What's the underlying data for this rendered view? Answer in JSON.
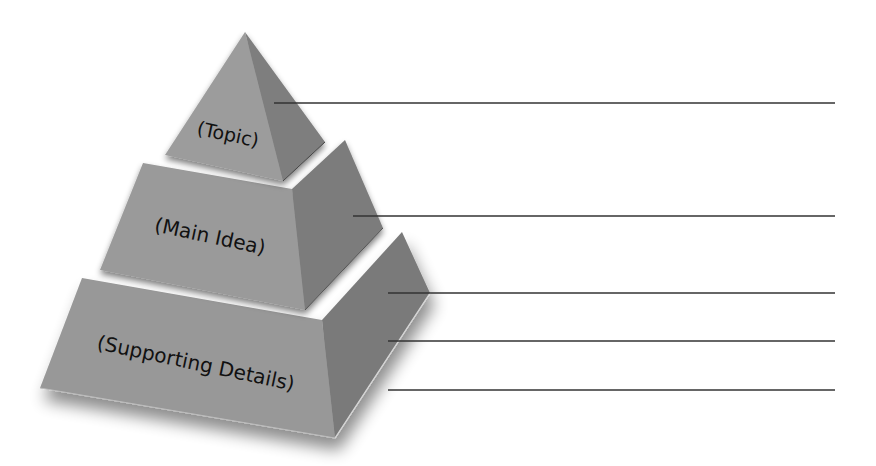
{
  "diagram": {
    "type": "pyramid",
    "tiers": [
      {
        "id": "topic",
        "label": "(Topic)",
        "front_color": "#9c9c9c",
        "side_color": "#7e7e7e",
        "font_size": 19,
        "text_x": 228,
        "text_y": 141
      },
      {
        "id": "main-idea",
        "label": "(Main Idea)",
        "front_color": "#9a9a9a",
        "side_color": "#7c7c7c",
        "font_size": 20,
        "text_x": 210,
        "text_y": 243
      },
      {
        "id": "supporting-details",
        "label": "(Supporting Details)",
        "front_color": "#989898",
        "side_color": "#7a7a7a",
        "font_size": 20,
        "text_x": 196,
        "text_y": 370
      }
    ],
    "answer_lines": [
      {
        "x1": 274,
        "y1": 103,
        "x2": 835,
        "y2": 103
      },
      {
        "x1": 353,
        "y1": 216,
        "x2": 835,
        "y2": 216
      },
      {
        "x1": 388,
        "y1": 293,
        "x2": 835,
        "y2": 293
      },
      {
        "x1": 388,
        "y1": 341,
        "x2": 835,
        "y2": 341
      },
      {
        "x1": 388,
        "y1": 390,
        "x2": 835,
        "y2": 390
      }
    ],
    "line_color": "#333333"
  }
}
